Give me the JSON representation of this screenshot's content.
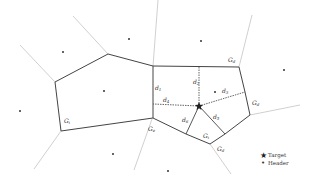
{
  "diagram": {
    "type": "voronoi-diagram",
    "colors": {
      "cell_edge": "#444444",
      "outer_edge": "#bbbbbb",
      "dashed": "#555555",
      "point": "#333333"
    },
    "target": {
      "x": 199,
      "y": 106,
      "icon": "star-icon"
    },
    "header_points": [
      {
        "x": 63,
        "y": 52
      },
      {
        "x": 129,
        "y": 39
      },
      {
        "x": 201,
        "y": 41
      },
      {
        "x": 284,
        "y": 70
      },
      {
        "x": 20,
        "y": 111
      },
      {
        "x": 104,
        "y": 91
      },
      {
        "x": 113,
        "y": 154
      },
      {
        "x": 215,
        "y": 92
      },
      {
        "x": 168,
        "y": 171
      }
    ],
    "distance_labels": [
      {
        "id": "d1",
        "text": "d",
        "sub": "1",
        "x": 155,
        "y": 87
      },
      {
        "id": "d2",
        "text": "d",
        "sub": "2",
        "x": 194,
        "y": 81
      },
      {
        "id": "d3",
        "text": "d",
        "sub": "3",
        "x": 223,
        "y": 92
      },
      {
        "id": "d4",
        "text": "d",
        "sub": "4",
        "x": 163,
        "y": 98
      },
      {
        "id": "d5",
        "text": "d",
        "sub": "5",
        "x": 214,
        "y": 116
      },
      {
        "id": "d6",
        "text": "d",
        "sub": "6",
        "x": 182,
        "y": 116
      }
    ],
    "cell_labels": [
      {
        "id": "g-left",
        "text": "G",
        "sub": "i",
        "x": 64,
        "y": 121
      },
      {
        "id": "g-lower-left",
        "text": "G",
        "sub": "e",
        "x": 148,
        "y": 123
      },
      {
        "id": "g-top-right",
        "text": "G",
        "sub": "d",
        "x": 228,
        "y": 55
      },
      {
        "id": "g-right",
        "text": "G",
        "sub": "d",
        "x": 252,
        "y": 100
      },
      {
        "id": "g-bottom",
        "text": "G",
        "sub": "i",
        "x": 205,
        "y": 134
      },
      {
        "id": "g-bottom-right",
        "text": "G",
        "sub": "d",
        "x": 216,
        "y": 146
      }
    ]
  },
  "legend": {
    "items": [
      {
        "symbol": "★",
        "label": "Target",
        "icon": "star-icon"
      },
      {
        "symbol": "•",
        "label": "Header",
        "icon": "dot-icon"
      }
    ]
  }
}
